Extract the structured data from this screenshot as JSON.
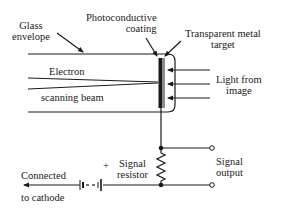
{
  "diagram": {
    "labels": {
      "glass_envelope": [
        "Glass",
        "envelope"
      ],
      "photoconductive_coating": [
        "Photoconductive",
        "coating"
      ],
      "transparent_metal_target": [
        "Transparent metal",
        "target"
      ],
      "electron_scanning_beam": [
        "Electron",
        "scanning beam"
      ],
      "light_from_image": [
        "Light from",
        "image"
      ],
      "signal_resistor": [
        "Signal",
        "resistor"
      ],
      "signal_output": [
        "Signal",
        "output"
      ],
      "connected_to_cathode": [
        "Connected",
        "to cathode"
      ],
      "battery_polarity": "+"
    },
    "colors": {
      "ink": "#1a1a1a",
      "background": "#ffffff"
    }
  }
}
